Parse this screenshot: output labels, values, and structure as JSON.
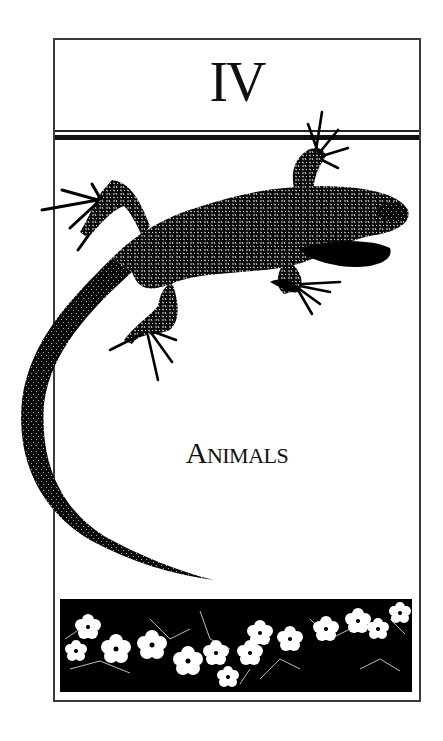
{
  "chapter": {
    "numeral": "IV",
    "title_first_letter": "A",
    "title_rest": "NIMALS",
    "title_full": "ANIMALS"
  },
  "illustration": {
    "main_subject": "lizard-illustration",
    "footer_band": "wildflower-band"
  },
  "colors": {
    "ink": "#111111",
    "paper": "#ffffff",
    "frame": "#3a3a3a"
  }
}
